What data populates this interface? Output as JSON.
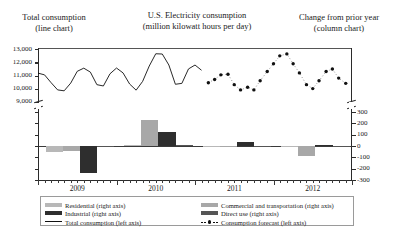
{
  "header": {
    "left_title": "Total consumption",
    "left_sub": "(line chart)",
    "center_title": "U.S. Electricity consumption",
    "center_sub": "(million kilowatt hours per day)",
    "right_title": "Change from prior year",
    "right_sub": "(column chart)"
  },
  "colors": {
    "residential": "#b8b8b8",
    "commercial": "#a8a8a8",
    "industrial": "#2e2e2e",
    "direct_use": "#555555",
    "line": "#111111",
    "axis": "#2b2b2b",
    "frame": "#555555",
    "background": "#ffffff"
  },
  "legend": {
    "items": [
      {
        "label": "Residential (right axis)",
        "swatch": "residential",
        "type": "swatch",
        "column": 1
      },
      {
        "label": "Industrial (right axis)",
        "swatch": "industrial",
        "type": "swatch",
        "column": 1
      },
      {
        "label": "Total consumption (left axis)",
        "swatch": "line",
        "type": "line",
        "column": 1
      },
      {
        "label": "Commercial and transportation (right axis)",
        "swatch": "commercial",
        "type": "swatch",
        "column": 2
      },
      {
        "label": "Direct use (right axis)",
        "swatch": "direct_use",
        "type": "swatch",
        "column": 2
      },
      {
        "label": "Consumption forecast (left axis)",
        "swatch": "line",
        "type": "dotted",
        "column": 2
      }
    ]
  },
  "chart_data": {
    "type": "line",
    "title": "U.S. Electricity consumption (million kilowatt hours per day)",
    "xlabel": "",
    "ylabel_left": "Total consumption (line chart)",
    "ylabel_right": "Change from prior year (column chart)",
    "grid": false,
    "legend_position": "bottom",
    "axis_break": true,
    "x_tick_labels": [
      "2009",
      "2010",
      "2011",
      "2012"
    ],
    "left_axis": {
      "ticks": [
        "13,000",
        "12,000",
        "11,000",
        "10,000",
        "9,000"
      ],
      "values": [
        13000,
        12000,
        11000,
        10000,
        9000
      ],
      "ylim": [
        9000,
        13000
      ],
      "units": "million kilowatt hours per day"
    },
    "right_axis": {
      "ticks": [
        "300",
        "200",
        "100",
        "0",
        "-100",
        "-200",
        "-300"
      ],
      "values": [
        300,
        200,
        100,
        0,
        -100,
        -200,
        -300
      ],
      "ylim": [
        -300,
        300
      ],
      "units": "million kilowatt hours per day change"
    },
    "series": [
      {
        "name": "Total consumption (left axis)",
        "type": "line",
        "axis": "left",
        "color": "#111111",
        "x": [
          2009.0,
          2009.083,
          2009.167,
          2009.25,
          2009.333,
          2009.417,
          2009.5,
          2009.583,
          2009.667,
          2009.75,
          2009.833,
          2009.917,
          2010.0,
          2010.083,
          2010.167,
          2010.25,
          2010.333,
          2010.417,
          2010.5,
          2010.583,
          2010.667,
          2010.75,
          2010.833,
          2010.917,
          2011.0,
          2011.083
        ],
        "values": [
          11180,
          11050,
          10450,
          9900,
          9830,
          10420,
          11320,
          11560,
          11260,
          10300,
          10200,
          11130,
          11570,
          11200,
          10350,
          9880,
          10550,
          11720,
          12660,
          12640,
          11800,
          10330,
          10400,
          11500,
          11800,
          11400
        ],
        "note": "monthly seasonal oscillation, historical solid line"
      },
      {
        "name": "Consumption forecast (left axis)",
        "type": "scatter-dotted",
        "axis": "left",
        "color": "#111111",
        "x": [
          2011.17,
          2011.25,
          2011.33,
          2011.42,
          2011.5,
          2011.58,
          2011.67,
          2011.75,
          2011.83,
          2011.92,
          2012.0,
          2012.08,
          2012.17,
          2012.25,
          2012.33,
          2012.42,
          2012.5,
          2012.58,
          2012.67,
          2012.75,
          2012.83,
          2012.92
        ],
        "values": [
          10450,
          10700,
          11050,
          11100,
          10300,
          9900,
          10100,
          9900,
          10600,
          11300,
          11900,
          12500,
          12650,
          11900,
          11200,
          10300,
          10000,
          10600,
          11300,
          11500,
          10800,
          10400
        ],
        "note": "forecast shown as dotted markers"
      },
      {
        "name": "Residential (right axis)",
        "type": "column",
        "axis": "right",
        "color": "#b8b8b8",
        "categories": [
          "2009",
          "2010",
          "2011",
          "2012"
        ],
        "values": [
          -52,
          12,
          -12,
          -4
        ]
      },
      {
        "name": "Commercial and transportation (right axis)",
        "type": "column",
        "axis": "right",
        "color": "#a8a8a8",
        "categories": [
          "2009",
          "2010",
          "2011",
          "2012"
        ],
        "values": [
          -40,
          232,
          -6,
          -88
        ]
      },
      {
        "name": "Industrial (right axis)",
        "type": "column",
        "axis": "right",
        "color": "#2e2e2e",
        "categories": [
          "2009",
          "2010",
          "2011",
          "2012"
        ],
        "values": [
          -238,
          120,
          36,
          8
        ]
      },
      {
        "name": "Direct use (right axis)",
        "type": "column",
        "axis": "right",
        "color": "#555555",
        "categories": [
          "2009",
          "2010",
          "2011",
          "2012"
        ],
        "values": [
          -10,
          6,
          -8,
          -4
        ]
      }
    ]
  }
}
